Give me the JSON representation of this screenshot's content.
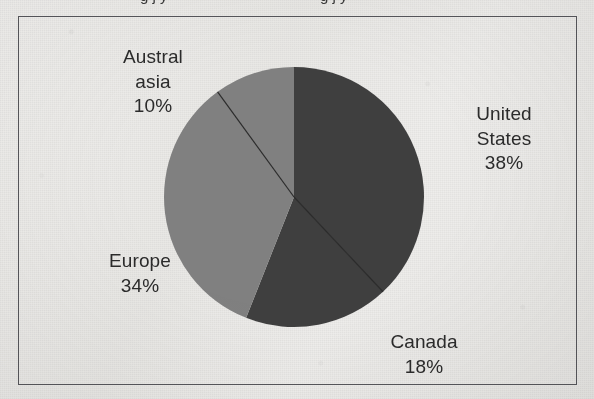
{
  "cropped_text_above": "g  j  y",
  "chart_data": {
    "type": "pie",
    "title": "",
    "categories": [
      "United States",
      "Canada",
      "Europe",
      "Australasia"
    ],
    "values": [
      38,
      18,
      34,
      10
    ],
    "value_unit": "%",
    "labels": [
      {
        "id": "united-states",
        "name_line1": "United",
        "name_line2": "States",
        "percent": "38%",
        "value": 38,
        "color": "#3f3f3f"
      },
      {
        "id": "canada",
        "name_line1": "Canada",
        "name_line2": "",
        "percent": "18%",
        "value": 18,
        "color": "#3f3f3f"
      },
      {
        "id": "europe",
        "name_line1": "Europe",
        "name_line2": "",
        "percent": "34%",
        "value": 34,
        "color": "#808080"
      },
      {
        "id": "australasia",
        "name_line1": "Austral",
        "name_line2": "asia",
        "percent": "10%",
        "value": 10,
        "color": "#808080"
      }
    ],
    "start_angle_deg": 0,
    "direction": "clockwise",
    "legend": "none",
    "legend_position": "data-labels-outside",
    "grid": false,
    "colors": {
      "dark_slice": "#3f3f3f",
      "light_slice": "#808080",
      "divider_line": "#2a2a2a",
      "frame_border": "#55555a",
      "background": "#eeeeec",
      "label_text": "#2b2b2b"
    }
  }
}
